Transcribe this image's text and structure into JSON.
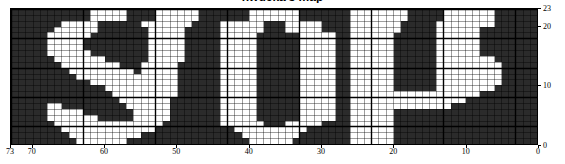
{
  "figure": {
    "title_fragment": "nwucka's map",
    "background_color": "#ffffff",
    "cell_on_color": "#ffffff",
    "cell_off_color": "#2b2b2b",
    "gridline_color": "#000000"
  },
  "plot": {
    "left": 10,
    "top": 8,
    "width": 528,
    "height": 137
  },
  "axes": {
    "x": {
      "reversed": true,
      "min": 0,
      "max": 73,
      "ticks": [
        73,
        70,
        60,
        50,
        40,
        30,
        20,
        10,
        0
      ],
      "tick_labels": [
        "73",
        "70",
        "60",
        "50",
        "40",
        "30",
        "20",
        "10",
        "0"
      ]
    },
    "y": {
      "side": "right",
      "min": 0,
      "max": 23,
      "ticks": [
        23,
        20,
        10,
        0
      ],
      "tick_labels": [
        "23",
        "20",
        "10",
        "0"
      ]
    }
  },
  "chart_data": {
    "type": "heatmap",
    "title": "nwucka's map",
    "xlabel": "",
    "ylabel": "",
    "xlim": [
      73,
      0
    ],
    "ylim": [
      0,
      23
    ],
    "grid": true,
    "legend": null,
    "colormap": [
      "#2b2b2b",
      "#ffffff"
    ],
    "value_labels": {
      "0": "off",
      "1": "on"
    },
    "ncols": 73,
    "nrows": 23,
    "major_gridline_spacing_x": 10,
    "major_gridline_spacing_y": 5,
    "depicted_text": "STOP",
    "note": "Binary occupancy grid; rows listed top (y=23) to bottom (y=0); each string is 73 chars of 0/1 from left (x=73) to right (x=0).",
    "rows": [
      "0000000000011111000011111100000001111111000000011111111000001111111000",
      "0000000000011111000011111100000001111111000000011111111000001111111000",
      "0000000111110000001111111000011111100011111000011111110000011111111000",
      "0000001111110000000111110000011111100011111000011111110000011111100000",
      "0000011111100000000111110000011111000000111110011111100000011111100000",
      "0000011111000000000111110000011111000000111110011111100000011111100000",
      "0000011111000000000111110000011111000000111110011111100000011111100000",
      "0000011111100000000111110000011111000000111110011111100000011111100000",
      "0000001111111000000111110000011111000000111110011111100000011111111000",
      "0000000111111110001111100000011111000000111110011111100000011111111100",
      "0000000011111111101111100000011111000000111110011111100000011111111100",
      "0000000001111111111111100000011111000000111110011111100000011111111100",
      "0000000000011111111111100000011111000000111110011111100000011111111100",
      "0000000000000111111111100000011111000000111110011111100000011111111000",
      "0000000000000011111111100000011111000000111110011111111111111111100000",
      "0000000000000001111111000000011111000000111110011111111111111110000000",
      "0000011000000000111111000000011111000000111110011111111111111000000000",
      "0000011111000000011111000000011111000000111110011111100000000000000000",
      "0000011111110000011111000000011111000000111110011111100000000000000000",
      "0000001111111111111110000000011111100011111000011111100000000000000000",
      "0000000111111111111100000000000111111111100000011111100000000000000000",
      "0000000011111111110000000000000011111111000000011111100000000000000000",
      "0000000001111111000000000000000001111110000000011111100000000000000000"
    ]
  }
}
